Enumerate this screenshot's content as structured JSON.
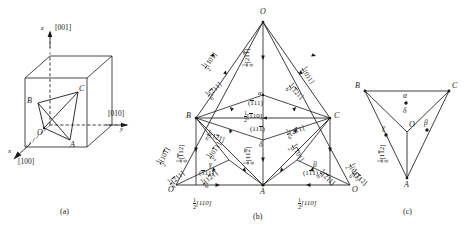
{
  "figure": {
    "panels": [
      {
        "key": "a",
        "caption": "(a)",
        "desc": "Tetrahedron inscribed in a cubic unit cell"
      },
      {
        "key": "b",
        "caption": "(b)",
        "desc": "Unfolded Thompson tetrahedron with Burgers vectors"
      },
      {
        "key": "c",
        "caption": "(c)",
        "desc": "Thompson tetrahedron face centres"
      }
    ],
    "colors": {
      "line": "#1a1a1a",
      "text": "#1a1a1a",
      "background": "#ffffff",
      "dashed": "#555555"
    }
  },
  "panel_a": {
    "caption": "(a)",
    "axes": [
      {
        "name": "z",
        "label": "z",
        "direction": "[001]"
      },
      {
        "name": "y",
        "label": "y",
        "direction": "[010]"
      },
      {
        "name": "x",
        "label": "x",
        "direction": "[100]"
      }
    ],
    "vertices": [
      {
        "name": "B",
        "label": "B"
      },
      {
        "name": "C",
        "label": "C"
      },
      {
        "name": "O",
        "label": "O"
      },
      {
        "name": "A",
        "label": "A"
      }
    ]
  },
  "panel_b": {
    "caption": "(b)",
    "vertices": [
      {
        "name": "O-top",
        "label": "O"
      },
      {
        "name": "B",
        "label": "B"
      },
      {
        "name": "C",
        "label": "C"
      },
      {
        "name": "A",
        "label": "A"
      },
      {
        "name": "O-left",
        "label": "O"
      },
      {
        "name": "O-right",
        "label": "O"
      }
    ],
    "greek": [
      {
        "name": "delta",
        "label": "δ"
      },
      {
        "name": "gamma",
        "label": "γ"
      },
      {
        "name": "beta",
        "label": "β"
      },
      {
        "name": "alpha-center",
        "label": "α"
      }
    ],
    "planes": [
      {
        "name": "plane-center-upper",
        "indices": "(111)",
        "bars": [
          0
        ]
      },
      {
        "name": "plane-center-lower",
        "indices": "(111)",
        "bars": [
          2
        ]
      },
      {
        "name": "plane-left-bottom",
        "indices": "(111)",
        "bars": [
          0
        ]
      },
      {
        "name": "plane-right-bottom",
        "indices": "(111)",
        "bars": [
          1
        ]
      }
    ],
    "perfect_vectors": [
      {
        "name": "b-OB",
        "num": "1",
        "den": "2",
        "indices": "[101]",
        "bars": []
      },
      {
        "name": "b-OC",
        "num": "1",
        "den": "2",
        "indices": "[011]",
        "bars": []
      },
      {
        "name": "b-BC",
        "num": "1",
        "den": "2",
        "indices": "[110]",
        "bars": [
          0
        ]
      },
      {
        "name": "b-outer-left",
        "num": "1",
        "den": "2",
        "indices": "[101]",
        "bars": [
          2
        ]
      },
      {
        "name": "b-left-inner",
        "num": "1",
        "den": "2",
        "indices": "[011]",
        "bars": [
          2
        ]
      },
      {
        "name": "b-mid-left",
        "num": "1",
        "den": "2",
        "indices": "[011]",
        "bars": [
          1
        ]
      },
      {
        "name": "b-mid-right",
        "num": "1",
        "den": "2",
        "indices": "[101]",
        "bars": [
          0
        ]
      },
      {
        "name": "b-right-inner",
        "num": "1",
        "den": "2",
        "indices": "[011]",
        "bars": []
      },
      {
        "name": "b-bottom-left",
        "num": "1",
        "den": "2",
        "indices": "[110]",
        "bars": []
      },
      {
        "name": "b-bottom-right",
        "num": "1",
        "den": "2",
        "indices": "[110]",
        "bars": []
      }
    ],
    "shockley_vectors": [
      {
        "name": "s-top-center",
        "num": "1",
        "den": "6",
        "indices": "[211]",
        "bars": [
          2
        ]
      },
      {
        "name": "s-upper-left",
        "num": "1",
        "den": "6",
        "indices": "[211]",
        "bars": [
          1
        ]
      },
      {
        "name": "s-upper-right",
        "num": "1",
        "den": "6",
        "indices": "[121]",
        "bars": [
          0
        ]
      },
      {
        "name": "s-mid-left",
        "num": "1",
        "den": "6",
        "indices": "[121]",
        "bars": [
          1
        ]
      },
      {
        "name": "s-mid-right",
        "num": "1",
        "den": "6",
        "indices": "[211]",
        "bars": [
          0
        ]
      },
      {
        "name": "s-left-vert",
        "num": "1",
        "den": "6",
        "indices": "[112]",
        "bars": [
          0
        ]
      },
      {
        "name": "s-left-outer",
        "num": "1",
        "den": "6",
        "indices": "[211]",
        "bars": [
          0
        ]
      },
      {
        "name": "s-left-low",
        "num": "1",
        "den": "6",
        "indices": "[121]",
        "bars": [
          1
        ]
      },
      {
        "name": "s-center-vert",
        "num": "1",
        "den": "6",
        "indices": "[112]",
        "bars": [
          2
        ]
      },
      {
        "name": "s-right-vert",
        "num": "1",
        "den": "6",
        "indices": "[112]",
        "bars": [
          1
        ]
      },
      {
        "name": "s-right-low",
        "num": "1",
        "den": "6",
        "indices": "[211]",
        "bars": [
          1
        ]
      },
      {
        "name": "s-right-outer",
        "num": "1",
        "den": "6",
        "indices": "[112]",
        "bars": [
          0
        ]
      }
    ]
  },
  "panel_c": {
    "caption": "(c)",
    "vertices": [
      {
        "name": "B",
        "label": "B"
      },
      {
        "name": "C",
        "label": "C"
      },
      {
        "name": "A",
        "label": "A"
      },
      {
        "name": "O",
        "label": "O"
      }
    ],
    "greek": [
      {
        "name": "alpha",
        "label": "α"
      },
      {
        "name": "delta",
        "label": "δ"
      },
      {
        "name": "beta",
        "label": "β"
      },
      {
        "name": "gamma",
        "label": "γ"
      }
    ]
  }
}
